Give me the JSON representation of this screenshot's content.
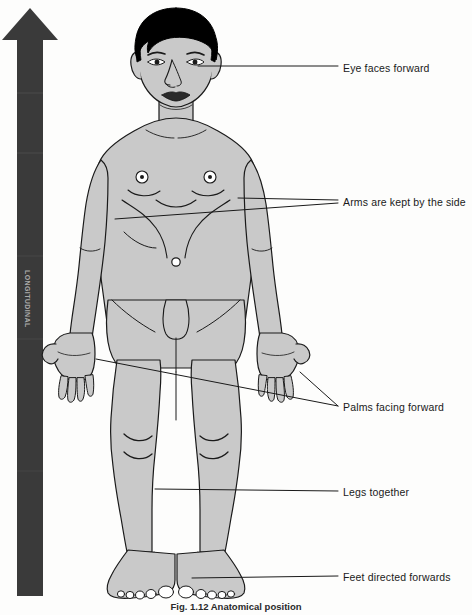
{
  "figure": {
    "caption": "Fig. 1.12   Anatomical position"
  },
  "arrow": {
    "name": "vertical-upward-axis-arrow",
    "label": "LONGITUDINAL",
    "color": "#3a3a3a",
    "direction": "up"
  },
  "colors": {
    "body_fill": "#c9c9c9",
    "outline": "#1a1a1a",
    "hair": "#000000",
    "arrow": "#3a3a3a",
    "label": "#1a1a1a",
    "background": "#fdfdfc"
  },
  "labels": [
    {
      "id": "eye-faces-forward",
      "text": "Eye faces forward",
      "x": 343,
      "y": 62
    },
    {
      "id": "arms-kept-by-side",
      "text": "Arms are kept by the side",
      "x": 343,
      "y": 197
    },
    {
      "id": "palms-facing-forward",
      "text": "Palms facing forward",
      "x": 343,
      "y": 402
    },
    {
      "id": "legs-together",
      "text": "Legs together",
      "x": 343,
      "y": 487
    },
    {
      "id": "feet-directed-forwards",
      "text": "Feet directed forwards",
      "x": 343,
      "y": 572
    }
  ],
  "body_parts": [
    "head",
    "hair",
    "eyes",
    "nose",
    "lips",
    "neck",
    "torso",
    "nipples",
    "navel",
    "arms",
    "hands",
    "palms",
    "fingers",
    "legs",
    "knees",
    "feet",
    "toes"
  ]
}
